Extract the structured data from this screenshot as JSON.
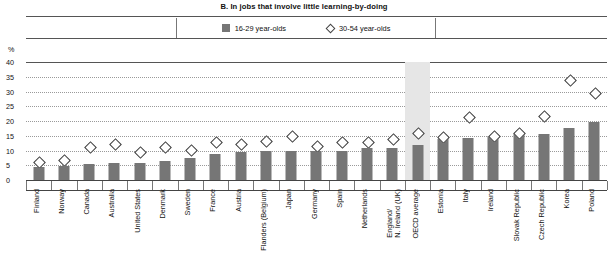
{
  "chart_data": {
    "type": "bar",
    "title": "B. In jobs that involve little learning-by-doing",
    "xlabel": "",
    "ylabel": "%",
    "ylim": [
      0,
      40
    ],
    "yticks": [
      0,
      5,
      10,
      15,
      20,
      25,
      30,
      35,
      40
    ],
    "grid": true,
    "legend_position": "top-center",
    "categories": [
      "Finland",
      "Norway",
      "Canada",
      "Australia",
      "United States",
      "Denmark",
      "Sweden",
      "France",
      "Austria",
      "Flanders (Belgium)",
      "Japan",
      "Germany",
      "Spain",
      "Netherlands",
      "England/\nN. Ireland (UK)",
      "OECD average",
      "Estonia",
      "Italy",
      "Ireland",
      "Slovak Republic",
      "Czech Republic",
      "Korea",
      "Poland"
    ],
    "highlighted_category": "OECD average",
    "series": [
      {
        "name": "16-29 year-olds",
        "marker": "bar",
        "color": "#767676",
        "values": [
          4.4,
          4.8,
          5.3,
          5.6,
          5.8,
          6.6,
          7.4,
          8.9,
          9.6,
          9.8,
          10.0,
          10.0,
          10.0,
          10.7,
          11.0,
          12.0,
          14.0,
          14.4,
          15.0,
          15.6,
          15.6,
          17.6,
          19.6
        ]
      },
      {
        "name": "30-54 year-olds",
        "marker": "diamond",
        "color": "#ffffff",
        "values": [
          6.3,
          6.8,
          11.2,
          12.4,
          9.6,
          11.2,
          10.5,
          13.2,
          12.4,
          13.4,
          15.0,
          11.8,
          13.2,
          13.0,
          14.2,
          16.2,
          14.6,
          21.5,
          15.2,
          16.0,
          21.8,
          34.0,
          29.6
        ]
      }
    ]
  },
  "legend": {
    "items": [
      {
        "label": "16-29 year-olds",
        "marker": "bar"
      },
      {
        "label": "30-54 year-olds",
        "marker": "diamond"
      }
    ]
  }
}
